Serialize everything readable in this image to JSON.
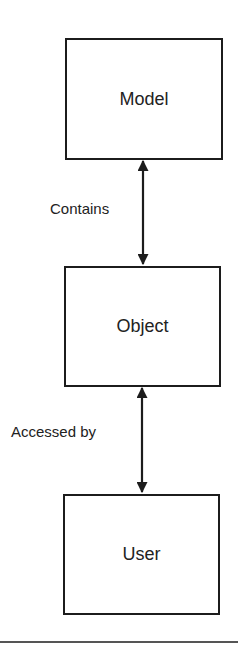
{
  "diagram": {
    "nodes": [
      {
        "id": "model",
        "label": "Model"
      },
      {
        "id": "object",
        "label": "Object"
      },
      {
        "id": "user",
        "label": "User"
      }
    ],
    "edges": [
      {
        "from": "model",
        "to": "object",
        "label": "Contains",
        "direction": "bidirectional"
      },
      {
        "from": "object",
        "to": "user",
        "label": "Accessed by",
        "direction": "bidirectional"
      }
    ],
    "colors": {
      "stroke": "#1c1c1c",
      "background": "#ffffff",
      "rule": "#555555"
    }
  }
}
